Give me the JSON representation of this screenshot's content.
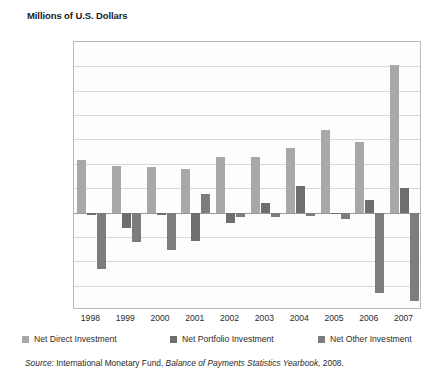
{
  "chart_data": {
    "type": "bar",
    "title": "Millions of U.S. Dollars",
    "xlabel": "",
    "ylabel": "Millions of U.S. Dollars",
    "ylim": [
      -80000,
      140000
    ],
    "ytick_step": 20000,
    "grid": true,
    "legend_position": "bottom",
    "categories": [
      "1998",
      "1999",
      "2000",
      "2001",
      "2002",
      "2003",
      "2004",
      "2005",
      "2006",
      "2007"
    ],
    "ytick_labels": [
      "$140,000",
      "$120,000",
      "$100,000",
      "$80,000",
      "$60,000",
      "$40,000",
      "$20,000",
      "$0",
      "−$20,000",
      "−$40,000",
      "−$60,000",
      "−$80,000"
    ],
    "ytick_values": [
      140000,
      120000,
      100000,
      80000,
      60000,
      40000,
      20000,
      0,
      -20000,
      -40000,
      -60000,
      -80000
    ],
    "series": [
      {
        "name": "Net Direct Investment",
        "color": "#a8a8a8",
        "values": [
          43000,
          38000,
          37000,
          36000,
          46000,
          46000,
          53000,
          68000,
          58000,
          121000
        ]
      },
      {
        "name": "Net Portfolio Investment",
        "color": "#6e6e6e",
        "values": [
          -2000,
          -13000,
          -2000,
          -23000,
          -9000,
          8000,
          22000,
          -1000,
          10000,
          20000
        ]
      },
      {
        "name": "Net Other Investment",
        "color": "#7d7d7d",
        "values": [
          -46000,
          -24000,
          -31000,
          15000,
          -4000,
          -4000,
          -3000,
          -5000,
          -66000,
          -73000
        ]
      }
    ],
    "source": {
      "prefix": "Source:",
      "agency": "International Monetary Fund,",
      "publication": "Balance of Payments Statistics Yearbook,",
      "year": "2008."
    }
  }
}
